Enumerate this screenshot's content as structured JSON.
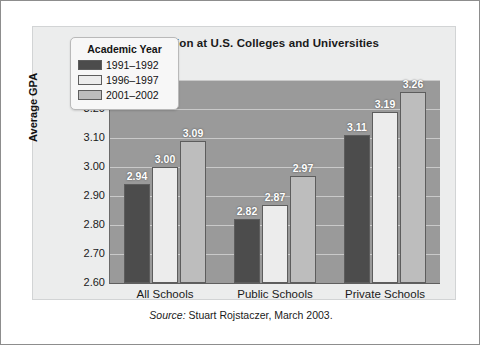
{
  "figure": {
    "title": "Grade Inflation at U.S. Colleges and Universities",
    "source_word": "Source:",
    "source_text": "Stuart Rojstaczer, March 2003."
  },
  "legend": {
    "title": "Academic Year",
    "entries": [
      "1991–1992",
      "1996–1997",
      "2001–2002"
    ]
  },
  "axes": {
    "ylabel": "Average GPA",
    "yticks": [
      "3.30",
      "3.20",
      "3.10",
      "3.00",
      "2.90",
      "2.80",
      "2.70",
      "2.60"
    ],
    "xticks": [
      "All Schools",
      "Public Schools",
      "Private Schools"
    ]
  },
  "colors": {
    "series_1991": "#4c4c4c",
    "series_1996": "#ececec",
    "series_2001": "#bdbdbd",
    "plot_background": "#9a9a9a",
    "panel_background": "#eceded",
    "gridline": "#c9c9c9"
  },
  "chart_data": {
    "type": "bar",
    "title": "Grade Inflation at U.S. Colleges and Universities",
    "xlabel": "",
    "ylabel": "Average GPA",
    "ylim": [
      2.6,
      3.3
    ],
    "ytick_step": 0.1,
    "grid": true,
    "legend_position": "upper-left-inside",
    "legend_title": "Academic Year",
    "categories": [
      "All Schools",
      "Public Schools",
      "Private Schools"
    ],
    "series": [
      {
        "name": "1991–1992",
        "values": [
          2.94,
          2.82,
          3.11
        ]
      },
      {
        "name": "1996–1997",
        "values": [
          3.0,
          2.87,
          3.19
        ]
      },
      {
        "name": "2001–2002",
        "values": [
          3.09,
          2.97,
          3.26
        ]
      }
    ],
    "data_labels": [
      [
        "2.94",
        "3.00",
        "3.09"
      ],
      [
        "2.82",
        "2.87",
        "2.97"
      ],
      [
        "3.11",
        "3.19",
        "3.26"
      ]
    ],
    "annotation": "Source: Stuart Rojstaczer, March 2003."
  }
}
